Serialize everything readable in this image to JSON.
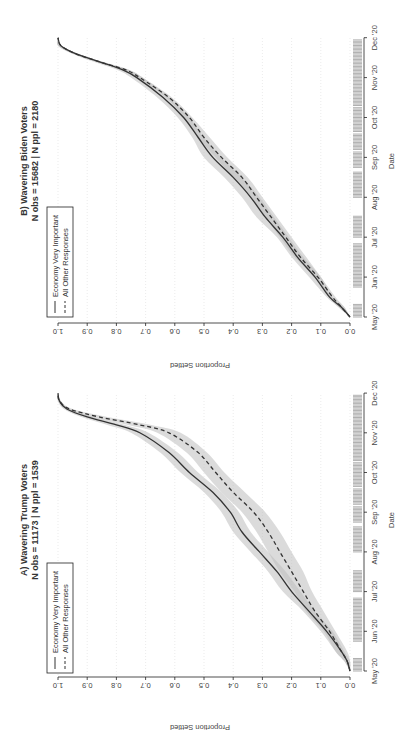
{
  "chart_data": [
    {
      "type": "line",
      "panel": "A",
      "title": "A) Wavering Trump Voters",
      "subtitle": "N obs = 11173 | N ppl = 1539",
      "xlabel": "Date",
      "ylabel": "Proportion Settled",
      "x_ticks": [
        "May '20",
        "Jun '20",
        "Jul '20",
        "Aug '20",
        "Sep '20",
        "Oct '20",
        "Nov '20",
        "Dec '20"
      ],
      "y_ticks": [
        "0.0",
        "0.1",
        "0.2",
        "0.3",
        "0.4",
        "0.5",
        "0.6",
        "0.7",
        "0.8",
        "0.9",
        "1.0"
      ],
      "ylim": [
        0,
        1
      ],
      "grid": "vertical dotted at y ticks",
      "legend": {
        "position": "top-left",
        "entries": [
          "Economy Very Important",
          "All Other Responses"
        ]
      },
      "x": [
        0,
        0.25,
        0.5,
        1,
        1.5,
        2,
        2.5,
        3,
        3.5,
        4,
        4.5,
        5,
        5.5,
        6,
        6.2,
        6.4,
        6.6,
        6.8,
        7
      ],
      "series": [
        {
          "name": "Economy Very Important",
          "style": "solid",
          "values": [
            0.0,
            0.01,
            0.03,
            0.08,
            0.14,
            0.2,
            0.25,
            0.31,
            0.37,
            0.41,
            0.47,
            0.55,
            0.62,
            0.72,
            0.8,
            0.9,
            0.97,
            0.995,
            1.0
          ],
          "ci_low": [
            0.0,
            0.0,
            0.02,
            0.06,
            0.12,
            0.17,
            0.22,
            0.28,
            0.34,
            0.38,
            0.44,
            0.52,
            0.59,
            0.69,
            0.77,
            0.88,
            0.96,
            0.99,
            1.0
          ],
          "ci_high": [
            0.0,
            0.02,
            0.05,
            0.1,
            0.16,
            0.23,
            0.28,
            0.34,
            0.4,
            0.44,
            0.5,
            0.58,
            0.65,
            0.75,
            0.83,
            0.92,
            0.98,
            1.0,
            1.0
          ]
        },
        {
          "name": "All Other Responses",
          "style": "dashed",
          "values": [
            0.0,
            0.01,
            0.03,
            0.07,
            0.12,
            0.16,
            0.2,
            0.24,
            0.28,
            0.33,
            0.4,
            0.46,
            0.52,
            0.62,
            0.72,
            0.86,
            0.96,
            0.995,
            1.0
          ],
          "ci_low": [
            0.0,
            0.0,
            0.01,
            0.05,
            0.09,
            0.13,
            0.16,
            0.2,
            0.24,
            0.29,
            0.36,
            0.43,
            0.49,
            0.58,
            0.68,
            0.83,
            0.95,
            0.99,
            1.0
          ],
          "ci_high": [
            0.0,
            0.02,
            0.05,
            0.09,
            0.15,
            0.19,
            0.24,
            0.28,
            0.32,
            0.37,
            0.44,
            0.5,
            0.56,
            0.66,
            0.76,
            0.89,
            0.97,
            1.0,
            1.0
          ]
        }
      ]
    },
    {
      "type": "line",
      "panel": "B",
      "title": "B) Wavering Biden Voters",
      "subtitle": "N obs = 15682 | N ppl = 2180",
      "xlabel": "Date",
      "ylabel": "Proportion Settled",
      "x_ticks": [
        "May '20",
        "Jun '20",
        "Jul '20",
        "Aug '20",
        "Sep '20",
        "Oct '20",
        "Nov '20",
        "Dec '20"
      ],
      "y_ticks": [
        "0.0",
        "0.1",
        "0.2",
        "0.3",
        "0.4",
        "0.5",
        "0.6",
        "0.7",
        "0.8",
        "0.9",
        "1.0"
      ],
      "ylim": [
        0,
        1
      ],
      "grid": "vertical dotted at y ticks",
      "legend": {
        "position": "top-left",
        "entries": [
          "Economy Very Important",
          "All Other Responses"
        ]
      },
      "x": [
        0,
        0.25,
        0.5,
        1,
        1.5,
        2,
        2.5,
        3,
        3.5,
        4,
        4.5,
        5,
        5.5,
        6,
        6.2,
        6.4,
        6.6,
        6.8,
        7
      ],
      "series": [
        {
          "name": "Economy Very Important",
          "style": "solid",
          "values": [
            0.0,
            0.03,
            0.07,
            0.12,
            0.18,
            0.23,
            0.29,
            0.34,
            0.4,
            0.47,
            0.52,
            0.57,
            0.64,
            0.73,
            0.78,
            0.86,
            0.94,
            0.99,
            1.0
          ],
          "ci_low": [
            0.0,
            0.02,
            0.06,
            0.1,
            0.16,
            0.21,
            0.26,
            0.31,
            0.37,
            0.44,
            0.5,
            0.55,
            0.62,
            0.71,
            0.76,
            0.85,
            0.93,
            0.99,
            1.0
          ],
          "ci_high": [
            0.0,
            0.04,
            0.08,
            0.14,
            0.2,
            0.25,
            0.32,
            0.37,
            0.43,
            0.5,
            0.54,
            0.59,
            0.66,
            0.75,
            0.8,
            0.88,
            0.95,
            1.0,
            1.0
          ]
        },
        {
          "name": "All Other Responses",
          "style": "dashed",
          "values": [
            0.0,
            0.03,
            0.06,
            0.11,
            0.17,
            0.22,
            0.27,
            0.32,
            0.37,
            0.44,
            0.5,
            0.55,
            0.62,
            0.72,
            0.77,
            0.86,
            0.94,
            0.99,
            1.0
          ],
          "ci_low": [
            0.0,
            0.02,
            0.05,
            0.1,
            0.15,
            0.2,
            0.25,
            0.3,
            0.35,
            0.42,
            0.48,
            0.54,
            0.61,
            0.71,
            0.76,
            0.85,
            0.93,
            0.99,
            1.0
          ],
          "ci_high": [
            0.0,
            0.04,
            0.07,
            0.12,
            0.19,
            0.24,
            0.29,
            0.34,
            0.4,
            0.46,
            0.52,
            0.57,
            0.63,
            0.73,
            0.79,
            0.87,
            0.95,
            1.0,
            1.0
          ]
        }
      ]
    }
  ],
  "rug": {
    "segments_months": [
      [
        0.0,
        0.35
      ],
      [
        0.75,
        1.85
      ],
      [
        2.0,
        2.55
      ],
      [
        3.0,
        3.65
      ],
      [
        3.75,
        4.15
      ],
      [
        4.2,
        4.6
      ],
      [
        4.65,
        5.25
      ],
      [
        5.3,
        6.95
      ]
    ]
  },
  "panels": {
    "a": {
      "title": "A) Wavering Trump Voters",
      "subtitle": "N obs = 11173 | N ppl = 1539"
    },
    "b": {
      "title": "B) Wavering Biden Voters",
      "subtitle": "N obs = 15682 | N ppl = 2180"
    },
    "xlabel": "Date",
    "ylabel": "Proportion Settled",
    "legend": {
      "solid": "Economy Very Important",
      "dashed": "All Other Responses"
    },
    "x_ticks": [
      "May '20",
      "Jun '20",
      "Jul '20",
      "Aug '20",
      "Sep '20",
      "Oct '20",
      "Nov '20",
      "Dec '20"
    ],
    "y_ticks": [
      "0.0",
      "0.1",
      "0.2",
      "0.3",
      "0.4",
      "0.5",
      "0.6",
      "0.7",
      "0.8",
      "0.9",
      "1.0"
    ]
  },
  "colors": {
    "line": "#333333",
    "band": "#bdbdbd",
    "rug": "#8c8c8c",
    "grid": "#dddddd"
  }
}
